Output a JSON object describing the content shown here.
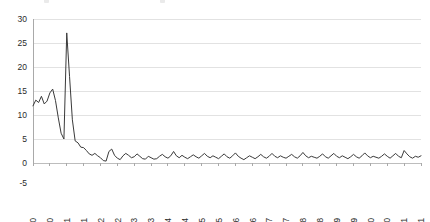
{
  "chart_data": {
    "type": "line",
    "title": "",
    "subtitle": "",
    "xlabel": "",
    "ylabel": "",
    "ylim": [
      -5,
      30
    ],
    "yticks": [
      -5,
      0,
      5,
      10,
      15,
      20,
      25,
      30
    ],
    "ytick_labels": [
      "-5",
      "0",
      "5",
      "10",
      "15",
      "20",
      "25",
      "30"
    ],
    "grid": "horizontal",
    "legend": "none",
    "line_color": "#3a3a3a",
    "grid_color": "#e2e2e2",
    "axis_color": "#a9a9a9",
    "xtick_labels": [
      "Mar-90",
      "Sep-90",
      "Mar-91",
      "Sep-91",
      "Mar-92",
      "Sep-92",
      "Mar-93",
      "Sep-93",
      "Mar-94",
      "Sep-94",
      "Mar-95",
      "Sep-95",
      "Mar-96",
      "Sep-96",
      "Mar-97",
      "Sep-97",
      "Mar-98",
      "Sep-98",
      "Mar-99",
      "Sep-99",
      "Mar-00",
      "Sep-00",
      "Mar-01",
      "Sep-01"
    ],
    "xtick_rotation": 90,
    "x_start": "Mar-90",
    "x_end": "Sep-01",
    "x_interval_months": 1,
    "x": [
      "Mar-90",
      "Apr-90",
      "May-90",
      "Jun-90",
      "Jul-90",
      "Aug-90",
      "Sep-90",
      "Oct-90",
      "Nov-90",
      "Dec-90",
      "Jan-91",
      "Feb-91",
      "Mar-91",
      "Apr-91",
      "May-91",
      "Jun-91",
      "Jul-91",
      "Aug-91",
      "Sep-91",
      "Oct-91",
      "Nov-91",
      "Dec-91",
      "Jan-92",
      "Feb-92",
      "Mar-92",
      "Apr-92",
      "May-92",
      "Jun-92",
      "Jul-92",
      "Aug-92",
      "Sep-92",
      "Oct-92",
      "Nov-92",
      "Dec-92",
      "Jan-93",
      "Feb-93",
      "Mar-93",
      "Apr-93",
      "May-93",
      "Jun-93",
      "Jul-93",
      "Aug-93",
      "Sep-93",
      "Oct-93",
      "Nov-93",
      "Dec-93",
      "Jan-94",
      "Feb-94",
      "Mar-94",
      "Apr-94",
      "May-94",
      "Jun-94",
      "Jul-94",
      "Aug-94",
      "Sep-94",
      "Oct-94",
      "Nov-94",
      "Dec-94",
      "Jan-95",
      "Feb-95",
      "Mar-95",
      "Apr-95",
      "May-95",
      "Jun-95",
      "Jul-95",
      "Aug-95",
      "Sep-95",
      "Oct-95",
      "Nov-95",
      "Dec-95",
      "Jan-96",
      "Feb-96",
      "Mar-96",
      "Apr-96",
      "May-96",
      "Jun-96",
      "Jul-96",
      "Aug-96",
      "Sep-96",
      "Oct-96",
      "Nov-96",
      "Dec-96",
      "Jan-97",
      "Feb-97",
      "Mar-97",
      "Apr-97",
      "May-97",
      "Jun-97",
      "Jul-97",
      "Aug-97",
      "Sep-97",
      "Oct-97",
      "Nov-97",
      "Dec-97",
      "Jan-98",
      "Feb-98",
      "Mar-98",
      "Apr-98",
      "May-98",
      "Jun-98",
      "Jul-98",
      "Aug-98",
      "Sep-98",
      "Oct-98",
      "Nov-98",
      "Dec-98",
      "Jan-99",
      "Feb-99",
      "Mar-99",
      "Apr-99",
      "May-99",
      "Jun-99",
      "Jul-99",
      "Aug-99",
      "Sep-99",
      "Oct-99",
      "Nov-99",
      "Dec-99",
      "Jan-00",
      "Feb-00",
      "Mar-00",
      "Apr-00",
      "May-00",
      "Jun-00",
      "Jul-00",
      "Aug-00",
      "Sep-00",
      "Oct-00",
      "Nov-00",
      "Dec-00",
      "Jan-01",
      "Feb-01",
      "Mar-01",
      "Apr-01",
      "May-01",
      "Jun-01",
      "Jul-01",
      "Aug-01",
      "Sep-01"
    ],
    "values": [
      11.9,
      13.1,
      12.6,
      13.9,
      12.3,
      12.9,
      14.6,
      15.4,
      13.0,
      9.4,
      6.2,
      5.0,
      27.1,
      18.0,
      9.0,
      4.6,
      4.2,
      3.3,
      3.2,
      2.6,
      1.9,
      1.6,
      2.0,
      1.5,
      1.1,
      0.5,
      0.4,
      2.4,
      2.9,
      1.6,
      1.0,
      0.7,
      1.5,
      2.0,
      1.6,
      1.1,
      1.3,
      1.9,
      1.4,
      0.9,
      0.8,
      1.4,
      1.1,
      0.8,
      0.9,
      1.4,
      1.8,
      1.3,
      1.0,
      1.5,
      2.4,
      1.5,
      1.1,
      1.6,
      1.2,
      0.9,
      1.3,
      1.7,
      1.3,
      1.0,
      1.5,
      2.0,
      1.4,
      1.1,
      1.5,
      1.2,
      0.9,
      1.4,
      1.9,
      1.3,
      1.0,
      1.5,
      2.1,
      1.4,
      1.0,
      0.7,
      1.1,
      1.5,
      1.2,
      0.9,
      1.3,
      1.8,
      1.3,
      1.0,
      1.4,
      2.0,
      1.4,
      1.1,
      1.5,
      1.2,
      1.0,
      1.4,
      1.8,
      1.3,
      1.0,
      1.5,
      2.2,
      1.5,
      1.1,
      1.4,
      1.2,
      1.0,
      1.4,
      1.9,
      1.3,
      1.0,
      1.5,
      2.0,
      1.4,
      1.1,
      1.5,
      1.2,
      0.9,
      1.3,
      1.8,
      1.3,
      1.0,
      1.5,
      2.1,
      1.5,
      1.1,
      1.4,
      1.2,
      1.0,
      1.4,
      1.9,
      1.4,
      1.0,
      1.5,
      2.0,
      1.4,
      1.1,
      2.6,
      1.9,
      1.3,
      1.0,
      1.4,
      1.2,
      1.5
    ]
  }
}
